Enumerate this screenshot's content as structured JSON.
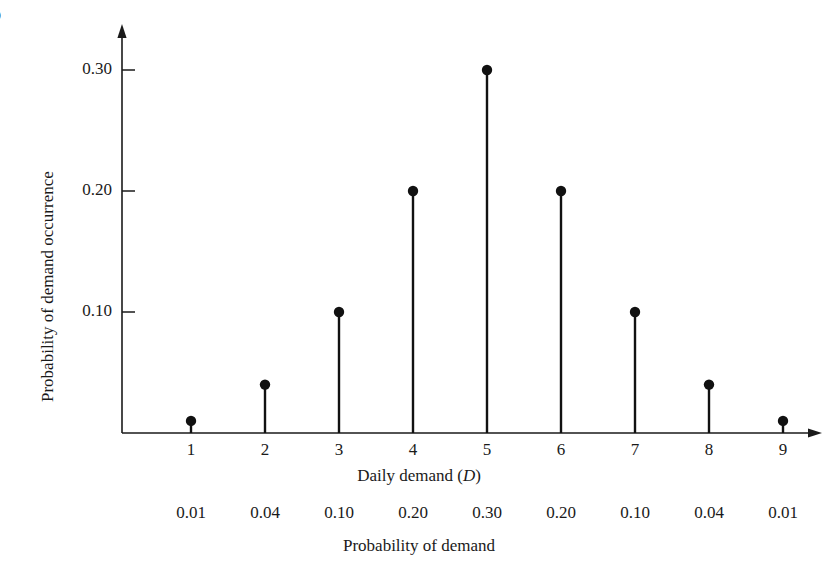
{
  "figure": {
    "number": "5",
    "number_sub": "n"
  },
  "chart_data": {
    "type": "scatter",
    "subtype": "stem-plot",
    "title": "",
    "xlabel": "Daily demand (D)",
    "ylabel": "Probability of demand occurrence",
    "x": [
      1,
      2,
      3,
      4,
      5,
      6,
      7,
      8,
      9
    ],
    "values": [
      0.01,
      0.04,
      0.1,
      0.2,
      0.3,
      0.2,
      0.1,
      0.04,
      0.01
    ],
    "categories": [
      "1",
      "2",
      "3",
      "4",
      "5",
      "6",
      "7",
      "8",
      "9"
    ],
    "xtick_labels": [
      "1",
      "2",
      "3",
      "4",
      "5",
      "6",
      "7",
      "8",
      "9"
    ],
    "ytick_labels": [
      "0.30",
      "0.20",
      "0.10"
    ],
    "ytick_values": [
      0.3,
      0.2,
      0.1
    ],
    "ylim": [
      0,
      0.335
    ],
    "xlim": [
      0.45,
      9.6
    ],
    "grid": false,
    "legend": false,
    "marker": "filled-circle",
    "marker_color": "#111111",
    "stem_color": "#111111",
    "axis_color": "#1a1a1a"
  },
  "axes": {
    "x_title": "Daily demand (",
    "x_title_var": "D",
    "x_title_close": ")",
    "y_title": "Probability of demand occurrence"
  },
  "prob_row": {
    "caption": "Probability of demand",
    "values": [
      "0.01",
      "0.04",
      "0.10",
      "0.20",
      "0.30",
      "0.20",
      "0.10",
      "0.04",
      "0.01"
    ]
  }
}
